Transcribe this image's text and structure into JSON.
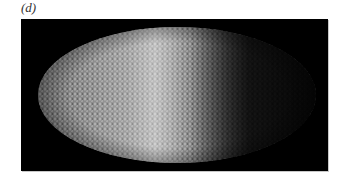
{
  "figure": {
    "panel_label": "(d)",
    "image": {
      "description": "Grayscale fluorescence micrograph of an elliptical embryo covered with densely packed nuclei; bright band near the anterior-middle, fading to dark toward the right",
      "background_color": "#000000",
      "brightest_tone": "#bdbdbd",
      "darkest_tone": "#0c0c0c"
    }
  }
}
